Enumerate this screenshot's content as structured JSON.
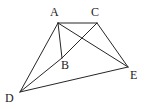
{
  "figure": {
    "name": "geometric-figure-abcde",
    "background_color": "#ffffff",
    "stroke_color": "#262626",
    "label_color": "#1a1a1a",
    "width": 149,
    "height": 109,
    "vertices": [
      {
        "id": "A",
        "label": "A",
        "x": 58,
        "y": 23,
        "label_x": 50,
        "label_y": 6
      },
      {
        "id": "C",
        "label": "C",
        "x": 97,
        "y": 23,
        "label_x": 91,
        "label_y": 6
      },
      {
        "id": "B",
        "label": "B",
        "x": 62,
        "y": 58,
        "label_x": 61,
        "label_y": 59
      },
      {
        "id": "D",
        "label": "D",
        "x": 20,
        "y": 92,
        "label_x": 5,
        "label_y": 92
      },
      {
        "id": "E",
        "label": "E",
        "x": 128,
        "y": 67,
        "label_x": 130,
        "label_y": 69
      }
    ],
    "edges": [
      {
        "id": "AC",
        "from": "A",
        "to": "C"
      },
      {
        "id": "AB",
        "from": "A",
        "to": "B"
      },
      {
        "id": "AD",
        "from": "A",
        "to": "D"
      },
      {
        "id": "AE",
        "from": "A",
        "to": "E"
      },
      {
        "id": "CB",
        "from": "C",
        "to": "B"
      },
      {
        "id": "CE",
        "from": "C",
        "to": "E"
      },
      {
        "id": "DB",
        "from": "D",
        "to": "B"
      },
      {
        "id": "DE",
        "from": "D",
        "to": "E"
      }
    ]
  }
}
